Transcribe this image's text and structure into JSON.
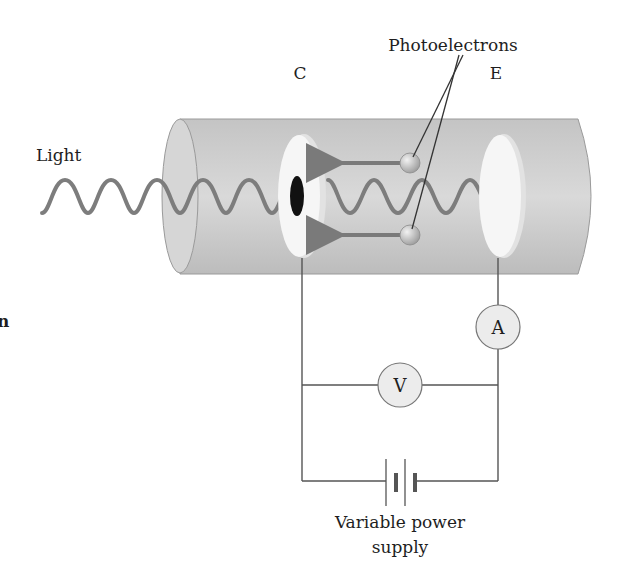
{
  "labels": {
    "light": "Light",
    "cathode": "C",
    "emitter": "E",
    "photoelectrons": "Photoelectrons",
    "ammeter": "A",
    "voltmeter": "V",
    "power_line1": "Variable power",
    "power_line2": "supply",
    "edge_fragment": "n"
  },
  "colors": {
    "tube_fill": "#c9c9c9",
    "tube_edge": "#9a9a9a",
    "plate_fill": "#f4f4f4",
    "wave": "#7d7d7d",
    "electron": "#bdbdbd",
    "arrow": "#7a7a7a",
    "meter_fill": "#ececec",
    "hole": "#111111"
  }
}
